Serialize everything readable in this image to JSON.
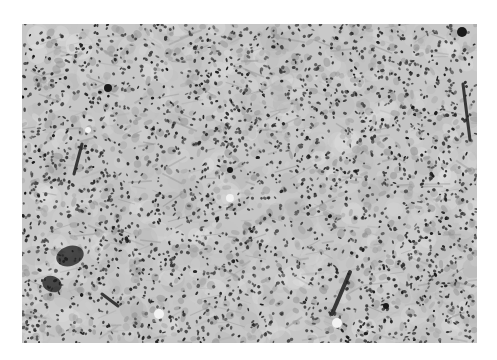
{
  "figure": {
    "type": "histology-micrograph",
    "color_mode": "grayscale",
    "frame": {
      "x": 22,
      "y": 24,
      "width": 455,
      "height": 319
    },
    "page_background": "#ffffff",
    "tissue": {
      "background_gray": "#c6c6c6",
      "light_patch_gray": "#dadada",
      "nucleus_gray": "#2a2a2a",
      "cytoplasm_gray": "#9a9a9a",
      "nucleus_density": 2600,
      "seed": 1337
    },
    "dark_structures": [
      {
        "label": "cluster",
        "cx": 48,
        "cy": 232,
        "rx": 14,
        "ry": 10,
        "angle": -0.3
      },
      {
        "label": "cluster",
        "cx": 30,
        "cy": 260,
        "rx": 10,
        "ry": 8,
        "angle": 0.4
      },
      {
        "label": "streak",
        "x1": 310,
        "y1": 290,
        "x2": 328,
        "y2": 248,
        "w": 4
      },
      {
        "label": "streak",
        "x1": 441,
        "y1": 60,
        "x2": 448,
        "y2": 116,
        "w": 3
      },
      {
        "label": "streak",
        "x1": 60,
        "y1": 120,
        "x2": 52,
        "y2": 150,
        "w": 3
      },
      {
        "label": "streak",
        "x1": 80,
        "y1": 270,
        "x2": 96,
        "y2": 282,
        "w": 3
      },
      {
        "label": "spot",
        "cx": 86,
        "cy": 64,
        "r": 4
      },
      {
        "label": "spot",
        "cx": 440,
        "cy": 8,
        "r": 5
      },
      {
        "label": "spot",
        "cx": 208,
        "cy": 146,
        "r": 3
      },
      {
        "label": "spot",
        "cx": 364,
        "cy": 282,
        "r": 3
      }
    ],
    "light_spots": [
      {
        "cx": 137,
        "cy": 290,
        "r": 5
      },
      {
        "cx": 315,
        "cy": 299,
        "r": 5
      },
      {
        "cx": 66,
        "cy": 106,
        "r": 3
      },
      {
        "cx": 208,
        "cy": 174,
        "r": 4
      }
    ]
  }
}
